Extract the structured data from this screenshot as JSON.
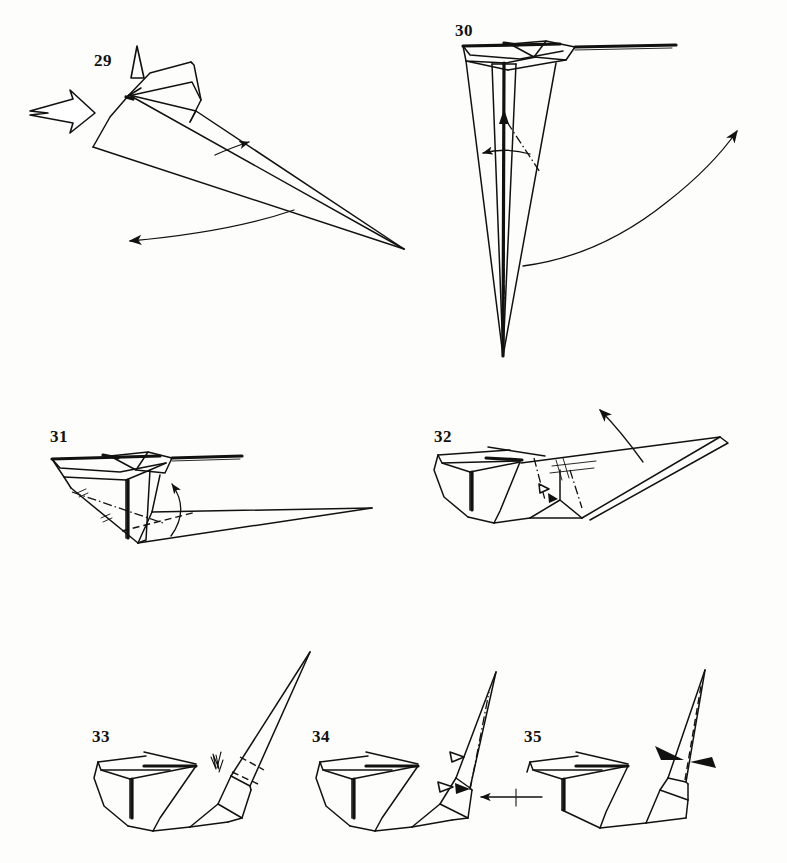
{
  "document": {
    "kind": "origami-instruction-diagram",
    "title": "Origami folding sequence, steps 29-35",
    "background_color": "#fdfdfb",
    "ink_color": "#111111",
    "page_width": 787,
    "page_height": 863
  },
  "steps": [
    {
      "id": "step-29",
      "number": "29",
      "label_x": 94,
      "label_y": 52,
      "symbols": [
        "push-arrow-hollow",
        "small-hollow-up-arrow",
        "fold-arrow-right",
        "fold-arrow-left-curved"
      ]
    },
    {
      "id": "step-30",
      "number": "30",
      "label_x": 455,
      "label_y": 22,
      "symbols": [
        "dash-dot-fold-line",
        "small-curved-left-arrow",
        "large-curved-up-right-arrow"
      ]
    },
    {
      "id": "step-31",
      "number": "31",
      "label_x": 50,
      "label_y": 428,
      "symbols": [
        "dash-dot-fold-line",
        "dashed-fold-line",
        "curved-up-arrow",
        "hatch-marks"
      ]
    },
    {
      "id": "step-32",
      "number": "32",
      "label_x": 434,
      "label_y": 428,
      "symbols": [
        "crimp-marks",
        "dash-dot-fold-line",
        "curved-up-right-arrow",
        "small-arrow"
      ]
    },
    {
      "id": "step-33",
      "number": "33",
      "label_x": 92,
      "label_y": 728,
      "symbols": [
        "zigzag-crimp-symbol",
        "dashed-fold-line"
      ]
    },
    {
      "id": "step-34",
      "number": "34",
      "label_x": 312,
      "label_y": 728,
      "symbols": [
        "dash-dot-fold-line",
        "push-in-arrow-left",
        "small-hollow-arrows"
      ]
    },
    {
      "id": "step-35",
      "number": "35",
      "label_x": 524,
      "label_y": 728,
      "symbols": [
        "pinch-arrow-left",
        "pinch-arrow-right",
        "dashed-center-line"
      ]
    }
  ]
}
